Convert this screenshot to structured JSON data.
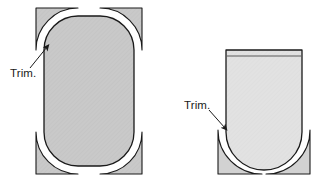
{
  "figure": {
    "background_color": "#ffffff",
    "line_color": "#1a1a1a",
    "annotations": [
      {
        "id": "left-trim-label",
        "text": "Trim.",
        "x": 10,
        "y": 73,
        "arrow_from": [
          33,
          66
        ],
        "arrow_to": [
          45,
          45
        ]
      },
      {
        "id": "right-trim-label",
        "text": "Trim.",
        "x": 184,
        "y": 112,
        "arrow_from": [
          208,
          112
        ],
        "arrow_to": [
          226,
          131
        ]
      }
    ],
    "shapes": [
      {
        "id": "left-part",
        "name": "rounded-rectangle-part",
        "description": "Rounded rectangle body with trim at all four corners",
        "body_fill": "#c9c9c9",
        "trim_fill": "#c9c9c9",
        "bounds": {
          "x": 36,
          "y": 8,
          "width": 106,
          "height": 166
        },
        "corner_radius": 34,
        "trim_corners": [
          "top-left",
          "top-right",
          "bottom-left",
          "bottom-right"
        ]
      },
      {
        "id": "right-part",
        "name": "u-shaped-vessel-part",
        "description": "Vessel with flat rim, straight sides, rounded bottom and trim at bottom two corners",
        "body_fill": "#e2e2e2",
        "trim_fill": "#d2d2d2",
        "bounds": {
          "x": 218,
          "y": 50,
          "width": 92,
          "height": 124
        },
        "corner_radius": 44,
        "rim_line_y": 56,
        "trim_corners": [
          "bottom-left",
          "bottom-right"
        ]
      }
    ]
  }
}
